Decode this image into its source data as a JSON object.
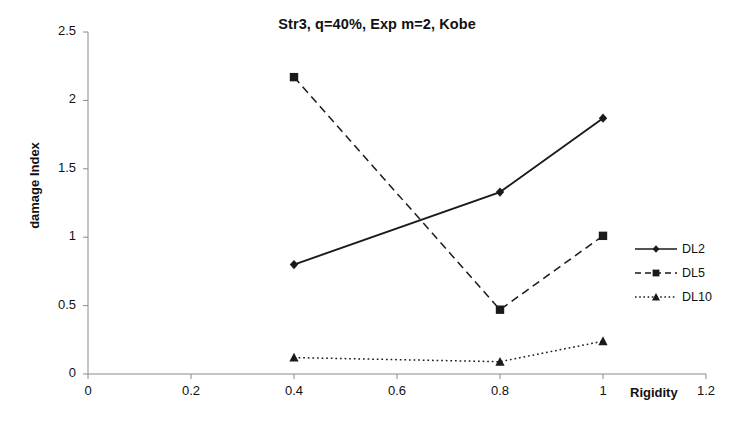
{
  "chart_data": {
    "type": "line",
    "title": "Str3, q=40%, Exp m=2, Kobe",
    "xlabel": "Rigidity",
    "ylabel": "damage Index",
    "x": [
      0.4,
      0.8,
      1.0
    ],
    "series": [
      {
        "name": "DL2",
        "values": [
          0.8,
          1.33,
          1.87
        ],
        "style": "solid",
        "marker": "diamond",
        "color": "#1a1a1a"
      },
      {
        "name": "DL5",
        "values": [
          2.17,
          0.47,
          1.01
        ],
        "style": "dashed",
        "marker": "square",
        "color": "#1a1a1a"
      },
      {
        "name": "DL10",
        "values": [
          0.12,
          0.09,
          0.24
        ],
        "style": "dotted",
        "marker": "triangle",
        "color": "#1a1a1a"
      }
    ],
    "xlim": [
      0,
      1.2
    ],
    "ylim": [
      0,
      2.5
    ],
    "xticks": [
      "0",
      "0.2",
      "0.4",
      "0.6",
      "0.8",
      "1",
      "1.2"
    ],
    "xtick_values": [
      0,
      0.2,
      0.4,
      0.6,
      0.8,
      1.0,
      1.2
    ],
    "yticks": [
      "0",
      "0.5",
      "1",
      "1.5",
      "2",
      "2.5"
    ],
    "ytick_values": [
      0,
      0.5,
      1.0,
      1.5,
      2.0,
      2.5
    ],
    "grid": false,
    "legend_position": "right"
  },
  "legend": {
    "items": [
      {
        "label": "DL2"
      },
      {
        "label": "DL5"
      },
      {
        "label": "DL10"
      }
    ]
  }
}
